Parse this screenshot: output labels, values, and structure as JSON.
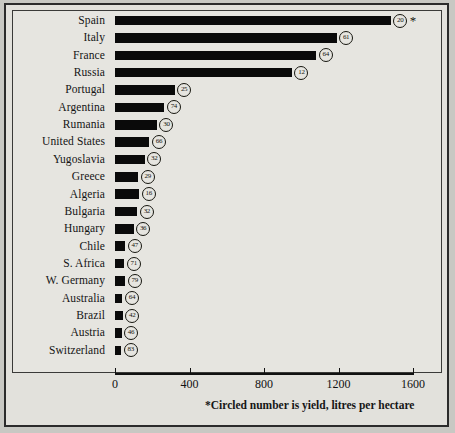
{
  "chart_data": {
    "type": "bar",
    "orientation": "horizontal",
    "title": "",
    "xlabel": "",
    "ylabel": "",
    "xlim": [
      0,
      1650
    ],
    "xticks": [
      0,
      400,
      800,
      1200,
      1600
    ],
    "xtick_labels": [
      "0",
      "400",
      "800",
      "1200",
      "1600"
    ],
    "grid": false,
    "legend": null,
    "footnote": "*Circled number is yield, litres per hectare",
    "asterisk_marker": "*",
    "value_annotation_label": "yield",
    "categories": [
      "Spain",
      "Italy",
      "France",
      "Russia",
      "Portugal",
      "Argentina",
      "Rumania",
      "United States",
      "Yugoslavia",
      "Greece",
      "Algeria",
      "Bulgaria",
      "Hungary",
      "Chile",
      "S. Africa",
      "W. Germany",
      "Australia",
      "Brazil",
      "Austria",
      "Switzerland"
    ],
    "values": [
      1480,
      1190,
      1080,
      950,
      320,
      265,
      225,
      185,
      160,
      125,
      130,
      120,
      100,
      55,
      50,
      55,
      40,
      42,
      35,
      33
    ],
    "yields": [
      20,
      61,
      64,
      12,
      25,
      74,
      30,
      66,
      32,
      29,
      16,
      32,
      36,
      47,
      71,
      79,
      64,
      42,
      46,
      83
    ],
    "points": [
      {
        "category": "Spain",
        "value": 1480,
        "yield": 20
      },
      {
        "category": "Italy",
        "value": 1190,
        "yield": 61
      },
      {
        "category": "France",
        "value": 1080,
        "yield": 64
      },
      {
        "category": "Russia",
        "value": 950,
        "yield": 12
      },
      {
        "category": "Portugal",
        "value": 320,
        "yield": 25
      },
      {
        "category": "Argentina",
        "value": 265,
        "yield": 74
      },
      {
        "category": "Rumania",
        "value": 225,
        "yield": 30
      },
      {
        "category": "United States",
        "value": 185,
        "yield": 66
      },
      {
        "category": "Yugoslavia",
        "value": 160,
        "yield": 32
      },
      {
        "category": "Greece",
        "value": 125,
        "yield": 29
      },
      {
        "category": "Algeria",
        "value": 130,
        "yield": 16
      },
      {
        "category": "Bulgaria",
        "value": 120,
        "yield": 32
      },
      {
        "category": "Hungary",
        "value": 100,
        "yield": 36
      },
      {
        "category": "Chile",
        "value": 55,
        "yield": 47
      },
      {
        "category": "S. Africa",
        "value": 50,
        "yield": 71
      },
      {
        "category": "W. Germany",
        "value": 55,
        "yield": 79
      },
      {
        "category": "Australia",
        "value": 40,
        "yield": 64
      },
      {
        "category": "Brazil",
        "value": 42,
        "yield": 42
      },
      {
        "category": "Austria",
        "value": 35,
        "yield": 46
      },
      {
        "category": "Switzerland",
        "value": 33,
        "yield": 83
      }
    ],
    "colors": {
      "bar": "#0a0a0a",
      "background": "#e6e5e0",
      "axis": "#111111",
      "text": "#141414",
      "frame": "#2b2b2b"
    }
  }
}
